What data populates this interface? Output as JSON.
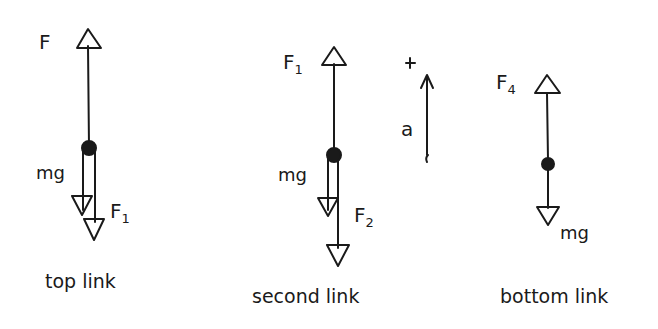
{
  "colors": {
    "ink": "#1a1a1a",
    "background": "#ffffff"
  },
  "diagrams": [
    {
      "caption": "top link",
      "forces": [
        {
          "label": "F",
          "sub": "",
          "direction": "up"
        },
        {
          "label": "mg",
          "sub": "",
          "direction": "down"
        },
        {
          "label": "F",
          "sub": "1",
          "direction": "down"
        }
      ]
    },
    {
      "caption": "second link",
      "forces": [
        {
          "label": "F",
          "sub": "1",
          "direction": "up"
        },
        {
          "label": "mg",
          "sub": "",
          "direction": "down"
        },
        {
          "label": "F",
          "sub": "2",
          "direction": "down"
        }
      ]
    },
    {
      "caption": "bottom link",
      "forces": [
        {
          "label": "F",
          "sub": "4",
          "direction": "up"
        },
        {
          "label": "mg",
          "sub": "",
          "direction": "down"
        }
      ]
    }
  ],
  "acceleration": {
    "sign": "+",
    "label": "a",
    "direction": "up"
  }
}
